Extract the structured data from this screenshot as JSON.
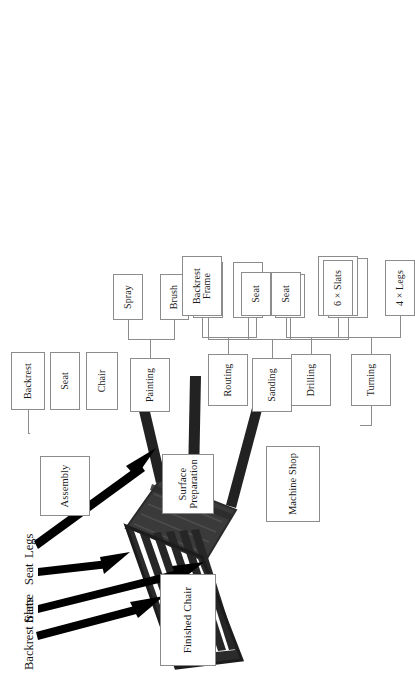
{
  "figure": {
    "kind": "process-tree",
    "orientation": "rotated-90-ccw",
    "line_color": "#8c8c8c",
    "box_fill": "#ffffff",
    "text_color": "#1a1a1a"
  },
  "tree": {
    "root": {
      "label": "Finished Chair"
    },
    "branches": [
      {
        "id": "assembly",
        "label": "Assembly",
        "children": [
          {
            "label": "Chair"
          },
          {
            "label": "Seat"
          },
          {
            "label": "Backrest"
          }
        ]
      },
      {
        "id": "surface_preparation",
        "label": "Surface\nPreparation",
        "children": [
          {
            "id": "sanding",
            "label": "Sanding",
            "children": [
              {
                "label": "Backrest\nFrame"
              },
              {
                "label": "Seat"
              },
              {
                "label": "4 × Legs"
              },
              {
                "label": "6 × Slats"
              }
            ]
          },
          {
            "id": "painting",
            "label": "Painting",
            "children": [
              {
                "label": "Brush"
              },
              {
                "label": "Spray"
              }
            ]
          }
        ]
      },
      {
        "id": "machine_shop",
        "label": "Machine Shop",
        "children": [
          {
            "id": "turning",
            "label": "Turning",
            "children": [
              {
                "label": "4 × Legs"
              },
              {
                "label": "6 × Slats"
              }
            ]
          },
          {
            "id": "drilling",
            "label": "Drilling",
            "children": [
              {
                "label": "Seat"
              },
              {
                "label": "Backrest\nFrame"
              }
            ]
          },
          {
            "id": "routing",
            "label": "Routing",
            "children": [
              {
                "label": "Seat"
              },
              {
                "label": "Backrest\nFrame"
              }
            ]
          }
        ]
      }
    ]
  },
  "photo": {
    "alt_name": "upside-down-wooden-chair-photo",
    "callouts": [
      {
        "id": "backrest_frame",
        "label": "Backrest frame"
      },
      {
        "id": "slats",
        "label": "Slats"
      },
      {
        "id": "seat",
        "label": "Seat"
      },
      {
        "id": "legs",
        "label": "Legs"
      }
    ]
  }
}
